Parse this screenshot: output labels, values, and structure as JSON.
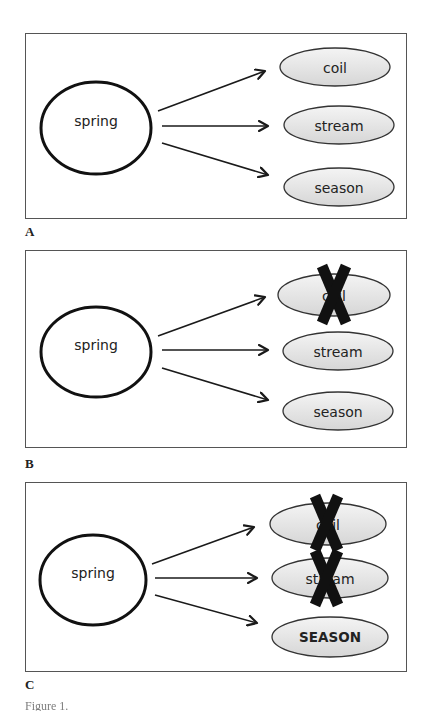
{
  "figure": {
    "panels": [
      {
        "label": "A",
        "source": "spring",
        "targets": [
          {
            "text": "coil",
            "crossed": false,
            "emphasized": false
          },
          {
            "text": "stream",
            "crossed": false,
            "emphasized": false
          },
          {
            "text": "season",
            "crossed": false,
            "emphasized": false
          }
        ]
      },
      {
        "label": "B",
        "source": "spring",
        "targets": [
          {
            "text": "coil",
            "crossed": true,
            "emphasized": false
          },
          {
            "text": "stream",
            "crossed": false,
            "emphasized": false
          },
          {
            "text": "season",
            "crossed": false,
            "emphasized": false
          }
        ]
      },
      {
        "label": "C",
        "source": "spring",
        "targets": [
          {
            "text": "coil",
            "crossed": true,
            "emphasized": false
          },
          {
            "text": "stream",
            "crossed": true,
            "emphasized": false
          },
          {
            "text": "SEASON",
            "crossed": false,
            "emphasized": true
          }
        ]
      }
    ],
    "caption_partial": "Figure 1."
  },
  "colors": {
    "frame": "#555555",
    "source_stroke": "#111111",
    "target_fill_top": "#f4f4f4",
    "target_fill_bottom": "#d8d8d8",
    "target_stroke": "#333333",
    "cross": "#111111",
    "arrow": "#1a1a1a"
  }
}
